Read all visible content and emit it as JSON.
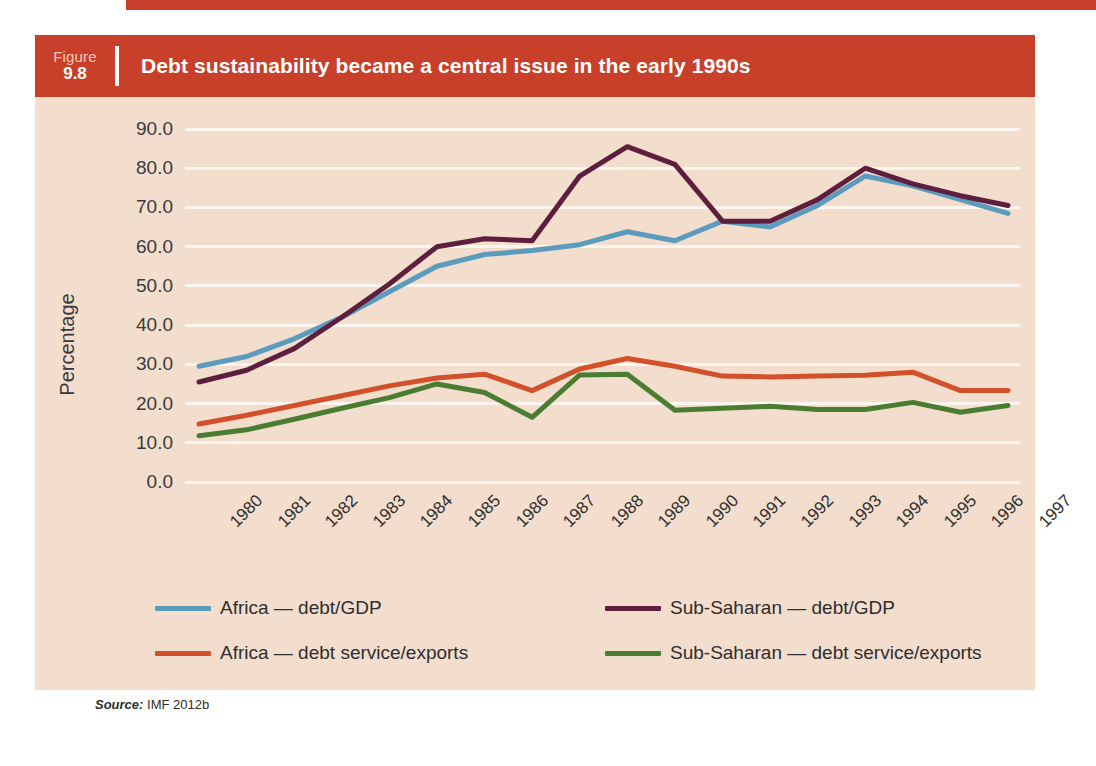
{
  "figure": {
    "label_word": "Figure",
    "number": "9.8",
    "title": "Debt sustainability became a central issue in the early 1990s",
    "header_color": "#c8402a",
    "panel_color": "#f3ddcc"
  },
  "source": {
    "label": "Source:",
    "text": "IMF 2012b"
  },
  "legend": [
    {
      "label": "Africa — debt/GDP",
      "color": "#5b9bbd"
    },
    {
      "label": "Sub-Saharan — debt/GDP",
      "color": "#5e1f3f"
    },
    {
      "label": "Africa — debt service/exports",
      "color": "#d2512a"
    },
    {
      "label": "Sub-Saharan — debt service/exports",
      "color": "#4a7c32"
    }
  ],
  "chart_data": {
    "type": "line",
    "title": "Debt sustainability became a central issue in the early 1990s",
    "xlabel": "",
    "ylabel": "Percentage",
    "ylim": [
      0,
      90
    ],
    "yticks": [
      "0.0",
      "10.0",
      "20.0",
      "30.0",
      "40.0",
      "50.0",
      "60.0",
      "70.0",
      "80.0",
      "90.0"
    ],
    "grid": true,
    "legend_position": "bottom",
    "categories": [
      "1980",
      "1981",
      "1982",
      "1983",
      "1984",
      "1985",
      "1986",
      "1987",
      "1988",
      "1989",
      "1990",
      "1991",
      "1992",
      "1993",
      "1994",
      "1995",
      "1996",
      "1997"
    ],
    "series": [
      {
        "name": "Africa — debt/GDP",
        "color": "#5b9bbd",
        "values": [
          29.5,
          32.0,
          36.5,
          42.0,
          48.5,
          55.0,
          58.0,
          59.0,
          60.5,
          63.8,
          61.5,
          66.5,
          65.0,
          70.5,
          78.0,
          75.5,
          72.0,
          68.5
        ]
      },
      {
        "name": "Sub-Saharan — debt/GDP",
        "color": "#5e1f3f",
        "values": [
          25.5,
          28.5,
          34.0,
          42.0,
          50.5,
          60.0,
          62.0,
          61.5,
          78.0,
          85.5,
          81.0,
          66.5,
          66.5,
          72.0,
          80.0,
          76.0,
          73.0,
          70.5
        ]
      },
      {
        "name": "Africa — debt service/exports",
        "color": "#d2512a",
        "values": [
          14.8,
          17.0,
          19.5,
          22.0,
          24.5,
          26.5,
          27.5,
          23.3,
          28.8,
          31.5,
          29.5,
          27.0,
          26.8,
          27.0,
          27.2,
          28.0,
          23.3,
          23.3
        ]
      },
      {
        "name": "Sub-Saharan — debt service/exports",
        "color": "#4a7c32",
        "values": [
          11.8,
          13.3,
          16.0,
          18.8,
          21.5,
          25.0,
          22.8,
          16.5,
          27.3,
          27.5,
          18.3,
          18.8,
          19.3,
          18.5,
          18.5,
          20.3,
          17.8,
          19.5
        ]
      }
    ]
  }
}
